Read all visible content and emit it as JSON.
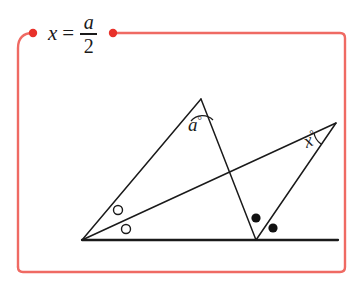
{
  "formula": {
    "lhs": "x",
    "equals": "=",
    "numerator": "a",
    "denominator": "2",
    "full_text": "x = a/2"
  },
  "colors": {
    "frame": "#ef6a63",
    "frame_dot": "#e8312a",
    "ink": "#1a1a1a",
    "background": "#ffffff"
  },
  "frame": {
    "corner_radius": 15,
    "dot_left_label": "connector-dot-left",
    "dot_right_label": "connector-dot-right"
  },
  "diagram": {
    "type": "euclidean-geometry",
    "labels": {
      "apex_angle": "a",
      "right_angle": "x",
      "degree_symbol": "°"
    },
    "points": {
      "left_vertex": [
        82,
        240
      ],
      "apex": [
        201,
        99
      ],
      "v_vertex": [
        256,
        240
      ],
      "right_vertex": [
        336,
        123
      ],
      "crossing": [
        225,
        171
      ],
      "baseline_start": [
        82,
        240
      ],
      "baseline_end": [
        338,
        240
      ]
    },
    "marks": {
      "open_circles": [
        [
          118,
          210
        ],
        [
          126,
          229
        ]
      ],
      "filled_dots": [
        [
          256,
          218
        ],
        [
          273,
          228
        ]
      ],
      "open_circle_radius": 4.5,
      "filled_dot_radius": 4.5
    }
  }
}
